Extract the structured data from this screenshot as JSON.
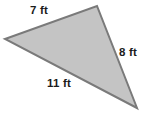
{
  "figure": {
    "name": "triangle-figure",
    "shape_type": "triangle",
    "background_color": "#ffffff",
    "fill_color": "#c4c4c4",
    "stroke_color": "#7a7a7a",
    "stroke_width": 2,
    "text_color": "#1c1c1c",
    "vertices": [
      {
        "name": "left-vertex",
        "x": 5,
        "y": 39
      },
      {
        "name": "top-vertex",
        "x": 97,
        "y": 6
      },
      {
        "name": "bottom-right-vertex",
        "x": 137,
        "y": 108
      }
    ],
    "polygon_points": "5,39 97,6 137,108",
    "sides": [
      {
        "id": "a",
        "label": "7 ft",
        "value": 7,
        "unit": "ft",
        "position": "top-left"
      },
      {
        "id": "b",
        "label": "8 ft",
        "value": 8,
        "unit": "ft",
        "position": "right"
      },
      {
        "id": "c",
        "label": "11 ft",
        "value": 11,
        "unit": "ft",
        "position": "bottom"
      }
    ]
  }
}
